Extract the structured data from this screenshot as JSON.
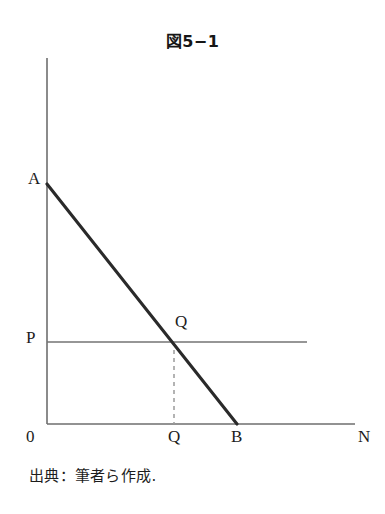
{
  "figure": {
    "title": "図5−1",
    "source_caption": "出典：筆者ら作成."
  },
  "labels": {
    "y_intercept": "A",
    "price_level": "P",
    "equilibrium_point": "Q",
    "origin": "0",
    "quantity_axis": "Q",
    "x_intercept": "B",
    "x_axis_name": "N"
  },
  "colors": {
    "ink": "#1c1c1c",
    "axis": "#6e6e6e",
    "demand_line": "#2a2a2a",
    "price_line": "#737373",
    "dashed_line": "#9a9a9a",
    "background": "#ffffff"
  },
  "chart_data": {
    "type": "line",
    "title": "図5−1",
    "xlabel": "N",
    "ylabel": "",
    "grid": false,
    "legend": null,
    "axes": {
      "x_axis": {
        "from_px": [
          47,
          424
        ],
        "to_px": [
          355,
          424
        ],
        "label": "N"
      },
      "y_axis": {
        "from_px": [
          47,
          424
        ],
        "to_px": [
          47,
          58
        ],
        "label": ""
      }
    },
    "series": [
      {
        "name": "demand-line-AB",
        "style": "solid-thick",
        "points_px": [
          [
            47,
            184
          ],
          [
            237,
            424
          ]
        ],
        "endpoint_labels": [
          "A",
          "B"
        ]
      },
      {
        "name": "price-line-P",
        "style": "solid-thin",
        "points_px": [
          [
            47,
            342
          ],
          [
            307,
            342
          ]
        ],
        "endpoint_labels": [
          "P",
          ""
        ]
      },
      {
        "name": "quantity-dropline-Q",
        "style": "dashed",
        "points_px": [
          [
            174,
            342
          ],
          [
            174,
            424
          ]
        ],
        "endpoint_labels": [
          "Q",
          "Q"
        ]
      }
    ],
    "annotations": [
      {
        "text": "A",
        "px": [
          35,
          182
        ],
        "note": "y-axis intercept of demand line"
      },
      {
        "text": "P",
        "px": [
          33,
          341
        ],
        "note": "price level on vertical axis"
      },
      {
        "text": "Q",
        "px": [
          182,
          325
        ],
        "note": "equilibrium point on demand line"
      },
      {
        "text": "0",
        "px": [
          33,
          440
        ],
        "note": "origin"
      },
      {
        "text": "Q",
        "px": [
          175,
          440
        ],
        "note": "equilibrium quantity on horizontal axis"
      },
      {
        "text": "B",
        "px": [
          238,
          440
        ],
        "note": "x-axis intercept of demand line"
      },
      {
        "text": "N",
        "px": [
          365,
          440
        ],
        "note": "horizontal axis name"
      }
    ]
  }
}
